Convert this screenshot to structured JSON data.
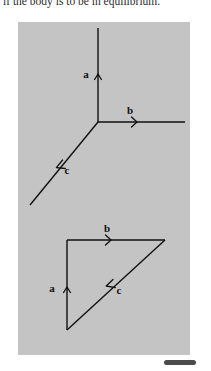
{
  "page": {
    "background_color": "#ffffff",
    "clipped_text": "if the body is to be in equilibrium."
  },
  "figure_panel": {
    "background_color": "#c4c4c4",
    "stroke_color": "#111111",
    "upper_diagram": {
      "name": "concurrent-force-diagram",
      "junction_point": {
        "x": 80,
        "y": 100
      },
      "vectors": [
        {
          "id": "a",
          "label": "a",
          "direction": "up",
          "tip": {
            "x": 80,
            "y": 6
          },
          "label_pos": {
            "x": 68,
            "y": 52
          }
        },
        {
          "id": "b",
          "label": "b",
          "direction": "right",
          "tip": {
            "x": 167,
            "y": 100
          },
          "label_pos": {
            "x": 110,
            "y": 90
          }
        },
        {
          "id": "c",
          "label": "c",
          "direction": "down-left",
          "tip": {
            "x": 12,
            "y": 183
          },
          "label_pos": {
            "x": 47,
            "y": 160
          }
        }
      ]
    },
    "lower_diagram": {
      "name": "force-triangle-diagram",
      "vertices": {
        "bottom_left": {
          "x": 49,
          "y": 308
        },
        "top_left": {
          "x": 49,
          "y": 218
        },
        "top_right": {
          "x": 147,
          "y": 218
        }
      },
      "vectors": [
        {
          "id": "a",
          "label": "a",
          "direction": "up",
          "label_pos": {
            "x": 32,
            "y": 266
          }
        },
        {
          "id": "b",
          "label": "b",
          "direction": "right",
          "label_pos": {
            "x": 90,
            "y": 210
          }
        },
        {
          "id": "c",
          "label": "c",
          "direction": "down-left",
          "label_pos": {
            "x": 104,
            "y": 273
          }
        }
      ]
    }
  },
  "bottom_bar": {
    "color": "#4a4a4a"
  }
}
